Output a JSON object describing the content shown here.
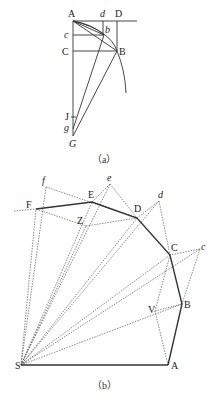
{
  "figure_a": {
    "caption": "（a）",
    "labels": {
      "A": "A",
      "d": "d",
      "D": "D",
      "c": "c",
      "b": "b",
      "C": "C",
      "B": "B",
      "J": "J",
      "g": "g",
      "G": "G"
    },
    "points": {
      "A": [
        73,
        21
      ],
      "D": [
        117,
        21
      ],
      "d": [
        103,
        21
      ],
      "c": [
        73,
        35
      ],
      "b": [
        104,
        35
      ],
      "C": [
        73,
        51
      ],
      "B": [
        117,
        51
      ],
      "J": [
        73,
        117
      ],
      "g": [
        73,
        129
      ],
      "G": [
        73,
        136
      ]
    }
  },
  "figure_b": {
    "caption": "（b）",
    "labels": {
      "S": "S",
      "A": "A",
      "B": "B",
      "C": "C",
      "D": "D",
      "E": "E",
      "F": "F",
      "f": "f",
      "e": "e",
      "d": "d",
      "c": "c",
      "Z": "Z",
      "V": "V"
    },
    "points": {
      "S": [
        21,
        365
      ],
      "A": [
        168,
        365
      ],
      "B": [
        182,
        304
      ],
      "C": [
        170,
        255
      ],
      "D": [
        137,
        218
      ],
      "E": [
        92,
        202
      ],
      "F": [
        36,
        209
      ],
      "f": [
        46,
        187
      ],
      "e": [
        110,
        184
      ],
      "d": [
        159,
        201
      ],
      "c": [
        200,
        249
      ],
      "Z": [
        86,
        226
      ],
      "V": [
        155,
        311
      ]
    }
  }
}
